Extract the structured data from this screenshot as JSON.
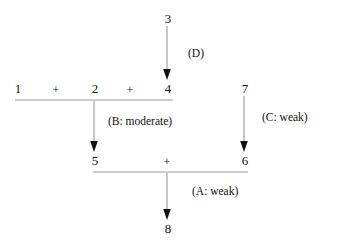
{
  "diagram": {
    "type": "reaction-flow-tree",
    "background_color": "#ffffff",
    "line_color": "#9a9a9a",
    "arrow_color": "#111111",
    "text_color": "#111111",
    "nodes": [
      {
        "id": "n1",
        "label": "1",
        "x": 17,
        "y": 88
      },
      {
        "id": "n2",
        "label": "2",
        "x": 94,
        "y": 88
      },
      {
        "id": "n4",
        "label": "4",
        "x": 167,
        "y": 88
      },
      {
        "id": "n3",
        "label": "3",
        "x": 167,
        "y": 18
      },
      {
        "id": "n7",
        "label": "7",
        "x": 244,
        "y": 88
      },
      {
        "id": "n5",
        "label": "5",
        "x": 94,
        "y": 160
      },
      {
        "id": "n6",
        "label": "6",
        "x": 244,
        "y": 160
      },
      {
        "id": "n8",
        "label": "8",
        "x": 167,
        "y": 228
      }
    ],
    "operators": [
      {
        "id": "plus1",
        "label": "+",
        "x": 56,
        "y": 89
      },
      {
        "id": "plus2",
        "label": "+",
        "x": 130,
        "y": 89
      },
      {
        "id": "plus3",
        "label": "+",
        "x": 167,
        "y": 161
      }
    ],
    "edge_labels": [
      {
        "id": "edgeD",
        "label": "(D)",
        "x": 188,
        "y": 48
      },
      {
        "id": "edgeB",
        "label": "(B: moderate)",
        "x": 108,
        "y": 116
      },
      {
        "id": "edgeC",
        "label": "(C: weak)",
        "x": 262,
        "y": 112
      },
      {
        "id": "edgeA",
        "label": "(A: weak)",
        "x": 192,
        "y": 186
      }
    ],
    "combination_bars": [
      {
        "id": "bar-top",
        "x1": 15,
        "x2": 173,
        "y": 100
      },
      {
        "id": "bar-bottom",
        "x1": 93,
        "x2": 248,
        "y": 172
      }
    ],
    "arrows": [
      {
        "id": "arrow-D",
        "from": "3",
        "to": "4",
        "x": 167,
        "y1": 26,
        "y2": 80,
        "label": "(D)"
      },
      {
        "id": "arrow-B",
        "from": "2",
        "to": "5",
        "x": 94,
        "y1": 101,
        "y2": 152,
        "label": "(B: moderate)"
      },
      {
        "id": "arrow-C",
        "from": "7",
        "to": "6",
        "x": 244,
        "y1": 96,
        "y2": 152,
        "label": "(C: weak)"
      },
      {
        "id": "arrow-A",
        "from": "+",
        "to": "8",
        "x": 167,
        "y1": 173,
        "y2": 220,
        "label": "(A: weak)"
      }
    ]
  }
}
